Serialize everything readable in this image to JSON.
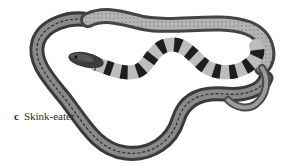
{
  "figure": {
    "panel_letter": "c",
    "caption": "Skink-eater",
    "colors": {
      "background": "#ffffff",
      "body_dark": "#3a3a3a",
      "body_mid": "#7a7a7a",
      "body_light": "#b8b8b8",
      "band_dark": "#1e1e1e",
      "band_light": "#c8c8c8",
      "caption_text": "#2a2a2a"
    }
  }
}
